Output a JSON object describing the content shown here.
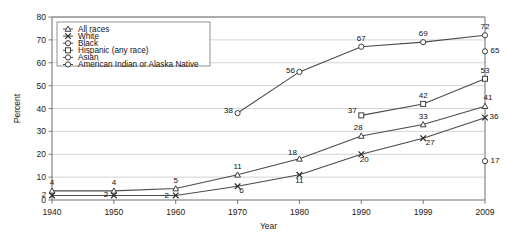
{
  "chart_data": {
    "type": "line",
    "title": "",
    "xlabel": "Year",
    "ylabel": "Percent",
    "categories": [
      "1940",
      "1950",
      "1960",
      "1970",
      "1980",
      "1990",
      "1999",
      "2009"
    ],
    "x": [
      1940,
      1950,
      1960,
      1970,
      1980,
      1990,
      1999,
      2009
    ],
    "ylim": [
      0,
      80
    ],
    "yticks": [
      "0",
      "10",
      "20",
      "30",
      "40",
      "50",
      "60",
      "70",
      "80"
    ],
    "grid": "horizontal",
    "legend_position": "upper-left",
    "series": [
      {
        "name": "All races",
        "marker": "triangle",
        "x": [
          1940,
          1950,
          1960,
          1970,
          1980,
          1990,
          1999,
          2009
        ],
        "values": [
          4,
          4,
          5,
          11,
          18,
          28,
          33,
          41
        ],
        "labels": [
          "4",
          "4",
          "5",
          "11",
          "18",
          "28",
          "33",
          "41"
        ]
      },
      {
        "name": "White",
        "marker": "x",
        "x": [
          1940,
          1950,
          1960,
          1970,
          1980,
          1990,
          1999,
          2009
        ],
        "values": [
          2,
          2,
          2,
          6,
          11,
          20,
          27,
          36
        ],
        "labels": [
          "2",
          "2",
          "2",
          "6",
          "11",
          "20",
          "27",
          "36"
        ]
      },
      {
        "name": "Black",
        "marker": "circle",
        "x": [
          1970,
          1980,
          1990,
          1999,
          2009
        ],
        "values": [
          38,
          56,
          67,
          69,
          72
        ],
        "labels": [
          "38",
          "56",
          "67",
          "69",
          "72"
        ]
      },
      {
        "name": "Hispanic (any race)",
        "marker": "square",
        "x": [
          1990,
          1999,
          2009
        ],
        "values": [
          37,
          42,
          53
        ],
        "labels": [
          "37",
          "42",
          "53"
        ]
      },
      {
        "name": "Asian",
        "marker": "circle",
        "x": [
          2009
        ],
        "values": [
          65
        ],
        "labels": [
          "65"
        ]
      },
      {
        "name": "American Indian or Alaska Native",
        "marker": "circle",
        "x": [
          2009
        ],
        "values": [
          17
        ],
        "labels": [
          "17"
        ]
      }
    ]
  },
  "legend": {
    "items": [
      {
        "label": "All races"
      },
      {
        "label": "White"
      },
      {
        "label": "Black"
      },
      {
        "label": "Hispanic (any race)"
      },
      {
        "label": "Asian"
      },
      {
        "label": "American Indian or Alaska Native"
      }
    ]
  },
  "axes": {
    "y_title": "Percent",
    "x_title": "Year",
    "y_ticks": [
      "80",
      "70",
      "60",
      "50",
      "40",
      "30",
      "20",
      "10",
      "0"
    ],
    "x_ticks": [
      "1940",
      "1950",
      "1960",
      "1970",
      "1980",
      "1990",
      "1999",
      "2009"
    ]
  }
}
